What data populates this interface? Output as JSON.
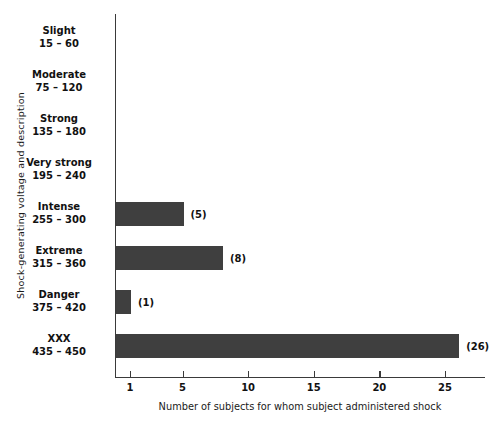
{
  "chart_data": {
    "type": "bar",
    "orientation": "horizontal",
    "title": "",
    "xlabel": "Number of subjects for whom subject administered shock",
    "ylabel": "Shock-generating voltage and description",
    "categories": [
      {
        "name": "Slight",
        "range": "15 – 60",
        "value": 0,
        "label": ""
      },
      {
        "name": "Moderate",
        "range": "75 – 120",
        "value": 0,
        "label": ""
      },
      {
        "name": "Strong",
        "range": "135 – 180",
        "value": 0,
        "label": ""
      },
      {
        "name": "Very strong",
        "range": "195 – 240",
        "value": 0,
        "label": ""
      },
      {
        "name": "Intense",
        "range": "255 – 300",
        "value": 5,
        "label": "(5)"
      },
      {
        "name": "Extreme",
        "range": "315 – 360",
        "value": 8,
        "label": "(8)"
      },
      {
        "name": "Danger",
        "range": "375 – 420",
        "value": 1,
        "label": "(1)"
      },
      {
        "name": "XXX",
        "range": "435 – 450",
        "value": 26,
        "label": "(26)"
      }
    ],
    "values": [
      0,
      0,
      0,
      0,
      5,
      8,
      1,
      26
    ],
    "xticks": [
      1,
      5,
      10,
      15,
      20,
      25
    ],
    "xtick_labels": [
      "1",
      "5",
      "10",
      "15",
      "20",
      "25"
    ],
    "xlim": [
      0,
      28
    ],
    "grid": false,
    "legend": false,
    "bar_color": "#3f3f3f",
    "axis_color": "#3a3a3a",
    "background": "#ffffff"
  }
}
